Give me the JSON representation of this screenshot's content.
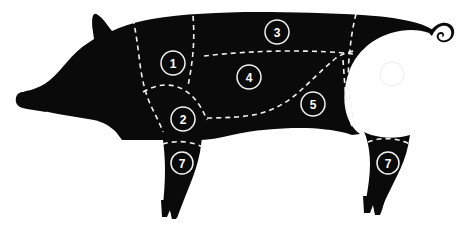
{
  "diagram": {
    "background_color": "#ffffff",
    "body_color": "#0a0a0a",
    "line_color": "#f2f2f2",
    "label_color": "#ffffff",
    "line_style": "dashed"
  },
  "markers": [
    {
      "id": "marker-1",
      "label": "1",
      "cx": 173,
      "cy": 63,
      "r": 12
    },
    {
      "id": "marker-2",
      "label": "2",
      "cx": 183,
      "cy": 119,
      "r": 12
    },
    {
      "id": "marker-3",
      "label": "3",
      "cx": 277,
      "cy": 32,
      "r": 12
    },
    {
      "id": "marker-4",
      "label": "4",
      "cx": 249,
      "cy": 77,
      "r": 12
    },
    {
      "id": "marker-5",
      "label": "5",
      "cx": 313,
      "cy": 104,
      "r": 12
    },
    {
      "id": "marker-6",
      "label": "6",
      "cx": 392,
      "cy": 74,
      "r": 12
    },
    {
      "id": "marker-7-front",
      "label": "7",
      "cx": 182,
      "cy": 163,
      "r": 11
    },
    {
      "id": "marker-7-rear",
      "label": "7",
      "cx": 388,
      "cy": 163,
      "r": 11
    }
  ]
}
